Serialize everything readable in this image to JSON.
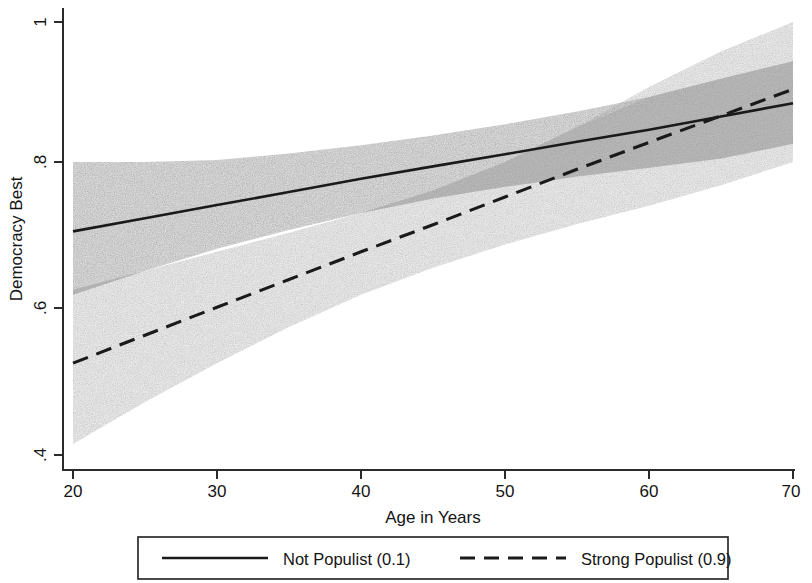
{
  "chart_data": {
    "type": "line",
    "title": "",
    "xlabel": "Age in Years",
    "ylabel": "Democracy Best",
    "xlim": [
      20,
      70
    ],
    "ylim": [
      0.4,
      1.0
    ],
    "xticks": [
      20,
      30,
      40,
      50,
      60,
      70
    ],
    "xtick_labels": [
      "20",
      "30",
      "40",
      "50",
      "60",
      "70"
    ],
    "yticks": [
      0.4,
      0.6,
      0.8,
      1.0
    ],
    "ytick_labels": [
      ".4",
      ".6",
      ".8",
      "1"
    ],
    "grid": false,
    "legend_position": "below-outside",
    "x": [
      20,
      25,
      30,
      35,
      40,
      45,
      50,
      55,
      60,
      65,
      70
    ],
    "series": [
      {
        "name": "Not Populist (0.1)",
        "style": "solid",
        "color": "#1a1a1a",
        "values": [
          0.705,
          0.723,
          0.741,
          0.759,
          0.777,
          0.794,
          0.811,
          0.829,
          0.846,
          0.865,
          0.884
        ],
        "ci_lower": [
          0.618,
          0.651,
          0.681,
          0.707,
          0.73,
          0.75,
          0.766,
          0.78,
          0.792,
          0.805,
          0.826
        ],
        "ci_upper": [
          0.8,
          0.8,
          0.803,
          0.812,
          0.824,
          0.838,
          0.854,
          0.872,
          0.893,
          0.919,
          0.944
        ],
        "band_color": "#bcbcbc"
      },
      {
        "name": "Strong Populist (0.9)",
        "style": "dashed",
        "color": "#1a1a1a",
        "values": [
          0.525,
          0.563,
          0.601,
          0.639,
          0.677,
          0.714,
          0.752,
          0.79,
          0.828,
          0.866,
          0.904
        ],
        "ci_lower": [
          0.415,
          0.472,
          0.525,
          0.574,
          0.618,
          0.655,
          0.687,
          0.715,
          0.74,
          0.768,
          0.8
        ],
        "ci_upper": [
          0.625,
          0.651,
          0.677,
          0.703,
          0.73,
          0.761,
          0.8,
          0.85,
          0.907,
          0.958,
          1.0
        ],
        "band_color": "#dedede"
      }
    ],
    "legend_entries": [
      {
        "label": "Not Populist (0.1)",
        "style": "solid"
      },
      {
        "label": "Strong Populist (0.9)",
        "style": "dashed"
      }
    ]
  },
  "axes": {
    "x_title": "Age in Years",
    "y_title": "Democracy Best"
  },
  "ticks": {
    "x": [
      "20",
      "30",
      "40",
      "50",
      "60",
      "70"
    ],
    "y": [
      "1",
      ".8",
      ".6",
      ".4"
    ]
  },
  "legend": {
    "entry_1": "Not Populist (0.1)",
    "entry_2": "Strong Populist (0.9)"
  },
  "colors": {
    "line": "#1a1a1a",
    "frame": "#2b2b2b",
    "band_solid": "#bcbcbc",
    "band_dashed": "#dedede",
    "background": "#ffffff"
  }
}
